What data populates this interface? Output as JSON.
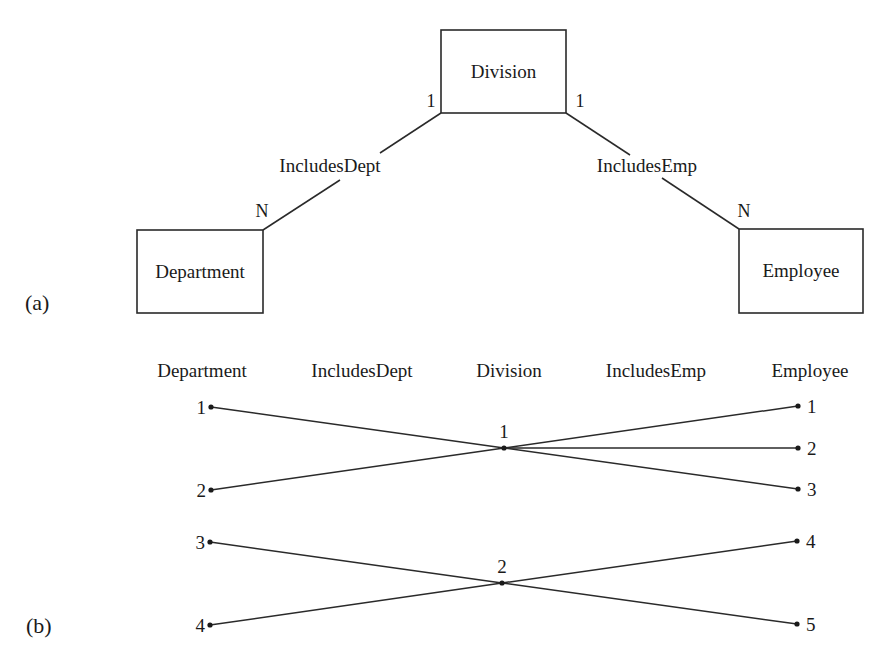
{
  "colors": {
    "background": "#ffffff",
    "ink": "#1a1a1a",
    "stroke": "#2a2a2a"
  },
  "part_a": {
    "label": "(a)",
    "label_pos": {
      "x": 25,
      "y": 310
    },
    "entities": [
      {
        "id": "division",
        "label": "Division",
        "x": 441,
        "y": 30,
        "w": 125,
        "h": 83
      },
      {
        "id": "department",
        "label": "Department",
        "x": 137,
        "y": 230,
        "w": 126,
        "h": 83
      },
      {
        "id": "employee",
        "label": "Employee",
        "x": 739,
        "y": 229,
        "w": 124,
        "h": 84
      }
    ],
    "relationships": [
      {
        "id": "includes-dept",
        "label": "IncludesDept",
        "label_pos": {
          "x": 330,
          "y": 172
        },
        "segments": [
          {
            "x1": 441,
            "y1": 113,
            "x2": 380,
            "y2": 153
          },
          {
            "x1": 340,
            "y1": 180,
            "x2": 263,
            "y2": 230
          }
        ],
        "cardinalities": [
          {
            "text": "1",
            "x": 431,
            "y": 107
          },
          {
            "text": "N",
            "x": 262,
            "y": 217
          }
        ]
      },
      {
        "id": "includes-emp",
        "label": "IncludesEmp",
        "label_pos": {
          "x": 647,
          "y": 172
        },
        "segments": [
          {
            "x1": 566,
            "y1": 113,
            "x2": 630,
            "y2": 155
          },
          {
            "x1": 662,
            "y1": 178,
            "x2": 739,
            "y2": 229
          }
        ],
        "cardinalities": [
          {
            "text": "1",
            "x": 580,
            "y": 107
          },
          {
            "text": "N",
            "x": 744,
            "y": 217
          }
        ]
      }
    ]
  },
  "part_b": {
    "label": "(b)",
    "label_pos": {
      "x": 26,
      "y": 633
    },
    "column_headers": [
      {
        "text": "Department",
        "x": 202,
        "y": 377
      },
      {
        "text": "IncludesDept",
        "x": 362,
        "y": 377
      },
      {
        "text": "Division",
        "x": 509,
        "y": 377
      },
      {
        "text": "IncludesEmp",
        "x": 656,
        "y": 377
      },
      {
        "text": "Employee",
        "x": 810,
        "y": 377
      }
    ],
    "department_instances": [
      {
        "id": "1",
        "x": 211,
        "y": 407
      },
      {
        "id": "2",
        "x": 211,
        "y": 490
      },
      {
        "id": "3",
        "x": 210,
        "y": 542
      },
      {
        "id": "4",
        "x": 210,
        "y": 625
      }
    ],
    "division_instances": [
      {
        "id": "1",
        "x": 504,
        "y": 448
      },
      {
        "id": "2",
        "x": 502,
        "y": 583
      }
    ],
    "employee_instances": [
      {
        "id": "1",
        "x": 798,
        "y": 406
      },
      {
        "id": "2",
        "x": 798,
        "y": 448
      },
      {
        "id": "3",
        "x": 798,
        "y": 489
      },
      {
        "id": "4",
        "x": 797,
        "y": 541
      },
      {
        "id": "5",
        "x": 797,
        "y": 624
      }
    ],
    "includes_dept_links": [
      {
        "department": "1",
        "division": "1"
      },
      {
        "department": "2",
        "division": "1"
      },
      {
        "department": "3",
        "division": "2"
      },
      {
        "department": "4",
        "division": "2"
      }
    ],
    "includes_emp_links": [
      {
        "division": "1",
        "employee": "1"
      },
      {
        "division": "1",
        "employee": "2"
      },
      {
        "division": "1",
        "employee": "3"
      },
      {
        "division": "2",
        "employee": "4"
      },
      {
        "division": "2",
        "employee": "5"
      }
    ]
  }
}
